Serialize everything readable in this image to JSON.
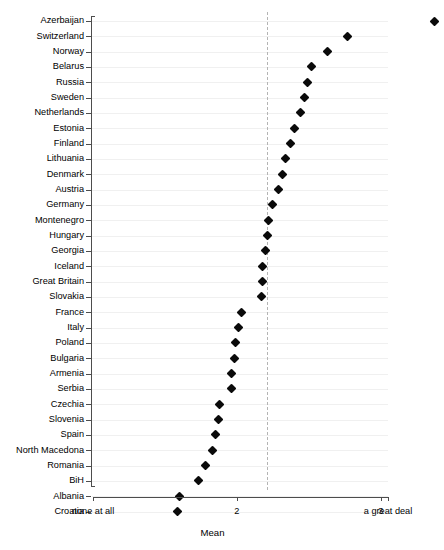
{
  "chart_data": {
    "type": "scatter",
    "title": "",
    "xlabel": "Mean",
    "ylabel": "",
    "xlim": [
      1.0,
      3.05
    ],
    "xticks": [
      1.0,
      2.0,
      3.0,
      3.05
    ],
    "xticklabels": [
      "none at all",
      "2",
      "3",
      "a great deal"
    ],
    "grid": true,
    "legend": null,
    "reference_line": 2.21,
    "categories": [
      "Azerbaijan",
      "Switzerland",
      "Norway",
      "Belarus",
      "Russia",
      "Sweden",
      "Netherlands",
      "Estonia",
      "Finland",
      "Lithuania",
      "Denmark",
      "Austria",
      "Germany",
      "Montenegro",
      "Hungary",
      "Georgia",
      "Iceland",
      "Great Britain",
      "Slovakia",
      "France",
      "Italy",
      "Poland",
      "Bulgaria",
      "Armenia",
      "Serbia",
      "Czechia",
      "Slovenia",
      "Spain",
      "North Macedona",
      "Romania",
      "BiH",
      "Albania",
      "Croatia"
    ],
    "values": [
      3.37,
      2.77,
      2.63,
      2.52,
      2.49,
      2.47,
      2.44,
      2.4,
      2.37,
      2.34,
      2.32,
      2.29,
      2.25,
      2.22,
      2.21,
      2.2,
      2.18,
      2.18,
      2.17,
      2.03,
      2.01,
      1.99,
      1.98,
      1.96,
      1.96,
      1.88,
      1.87,
      1.85,
      1.83,
      1.78,
      1.73,
      1.6,
      1.59
    ]
  }
}
